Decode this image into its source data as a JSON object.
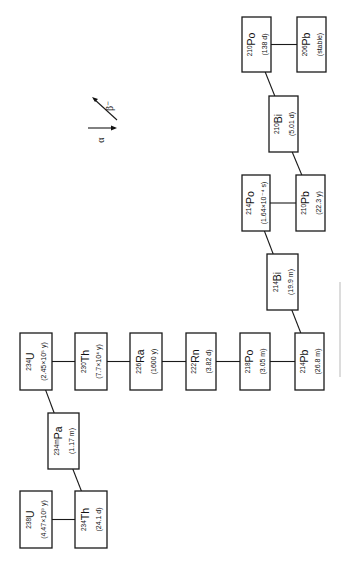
{
  "legend": {
    "alpha": {
      "symbol": "α",
      "meaning": "alpha decay"
    },
    "beta": {
      "symbol": "β⁻",
      "meaning": "beta-minus decay"
    }
  },
  "nuclides": [
    {
      "id": "u238",
      "mass": "238",
      "symbol": "U",
      "half_life": "(4.47×10⁹ y)"
    },
    {
      "id": "th234",
      "mass": "234",
      "symbol": "Th",
      "half_life": "(24.1 d)"
    },
    {
      "id": "pa234m",
      "mass": "234m",
      "symbol": "Pa",
      "half_life": "(1.17 m)"
    },
    {
      "id": "u234",
      "mass": "234",
      "symbol": "U",
      "half_life": "(2.45×10⁵ y)"
    },
    {
      "id": "th230",
      "mass": "230",
      "symbol": "Th",
      "half_life": "(7.7×10⁴ y)"
    },
    {
      "id": "ra226",
      "mass": "226",
      "symbol": "Ra",
      "half_life": "(1600 y)"
    },
    {
      "id": "rn222",
      "mass": "222",
      "symbol": "Rn",
      "half_life": "(3.82 d)"
    },
    {
      "id": "po218",
      "mass": "218",
      "symbol": "Po",
      "half_life": "(3.05 m)"
    },
    {
      "id": "pb214",
      "mass": "214",
      "symbol": "Pb",
      "half_life": "(26.8 m)"
    },
    {
      "id": "bi214",
      "mass": "214",
      "symbol": "Bi",
      "half_life": "(19.9 m)"
    },
    {
      "id": "po214",
      "mass": "214",
      "symbol": "Po",
      "half_life": "(1.64×10⁻⁴ s)"
    },
    {
      "id": "pb210",
      "mass": "210",
      "symbol": "Pb",
      "half_life": "(22.3 y)"
    },
    {
      "id": "bi210",
      "mass": "210",
      "symbol": "Bi",
      "half_life": "(5.01 d)"
    },
    {
      "id": "po210",
      "mass": "210",
      "symbol": "Po",
      "half_life": "(138 d)"
    },
    {
      "id": "pb206",
      "mass": "206",
      "symbol": "Pb",
      "half_life": "(stable)"
    }
  ],
  "decays": [
    {
      "from": "u238",
      "to": "th234",
      "mode": "alpha"
    },
    {
      "from": "th234",
      "to": "pa234m",
      "mode": "beta"
    },
    {
      "from": "pa234m",
      "to": "u234",
      "mode": "beta"
    },
    {
      "from": "u234",
      "to": "th230",
      "mode": "alpha"
    },
    {
      "from": "th230",
      "to": "ra226",
      "mode": "alpha"
    },
    {
      "from": "ra226",
      "to": "rn222",
      "mode": "alpha"
    },
    {
      "from": "rn222",
      "to": "po218",
      "mode": "alpha"
    },
    {
      "from": "po218",
      "to": "pb214",
      "mode": "alpha"
    },
    {
      "from": "pb214",
      "to": "bi214",
      "mode": "beta"
    },
    {
      "from": "bi214",
      "to": "po214",
      "mode": "beta"
    },
    {
      "from": "po214",
      "to": "pb210",
      "mode": "alpha"
    },
    {
      "from": "pb210",
      "to": "bi210",
      "mode": "beta"
    },
    {
      "from": "bi210",
      "to": "po210",
      "mode": "beta"
    },
    {
      "from": "po210",
      "to": "pb206",
      "mode": "alpha"
    }
  ]
}
